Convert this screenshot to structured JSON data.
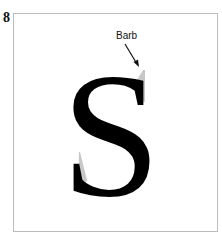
{
  "figure": {
    "number": "8",
    "letter": "S",
    "annotation": {
      "label": "Barb",
      "target": "upper-terminal-barb"
    },
    "colors": {
      "glyph": "#000000",
      "barb_highlight": "#c8c8c8",
      "frame_border": "#bcbcbc"
    }
  }
}
